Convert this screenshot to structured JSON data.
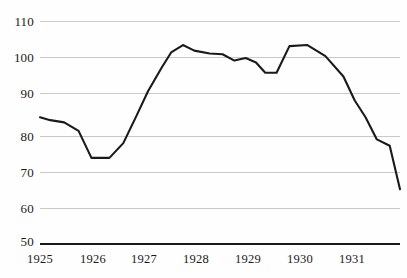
{
  "chart_data": {
    "type": "line",
    "title": "",
    "xlabel": "",
    "ylabel": "",
    "ylim": [
      50,
      110
    ],
    "xlim": [
      1925,
      1932
    ],
    "grid": true,
    "legend": null,
    "y_ticks": [
      110,
      100,
      90,
      80,
      70,
      60,
      50
    ],
    "x_ticks": [
      1925,
      1926,
      1927,
      1928,
      1929,
      1930,
      1931
    ],
    "line_color": "#1a1a1a",
    "grid_color": "#c9c9c9",
    "series": [
      {
        "name": "index",
        "x": [
          1925.0,
          1925.2,
          1925.47,
          1925.75,
          1926.0,
          1926.35,
          1926.62,
          1926.88,
          1927.1,
          1927.37,
          1927.55,
          1927.78,
          1928.0,
          1928.3,
          1928.55,
          1928.78,
          1929.0,
          1929.2,
          1929.38,
          1929.6,
          1929.85,
          1930.2,
          1930.55,
          1930.9,
          1931.12,
          1931.33,
          1931.55,
          1931.8,
          1932.0
        ],
        "values": [
          84.0,
          83.2,
          82.6,
          80.3,
          73.0,
          73.0,
          77.0,
          84.5,
          91.0,
          97.5,
          101.5,
          103.5,
          102.0,
          101.2,
          101.0,
          99.3,
          100.0,
          98.8,
          96.0,
          96.0,
          103.2,
          103.5,
          100.5,
          95.0,
          88.5,
          84.0,
          78.0,
          76.3,
          64.5
        ]
      }
    ]
  }
}
